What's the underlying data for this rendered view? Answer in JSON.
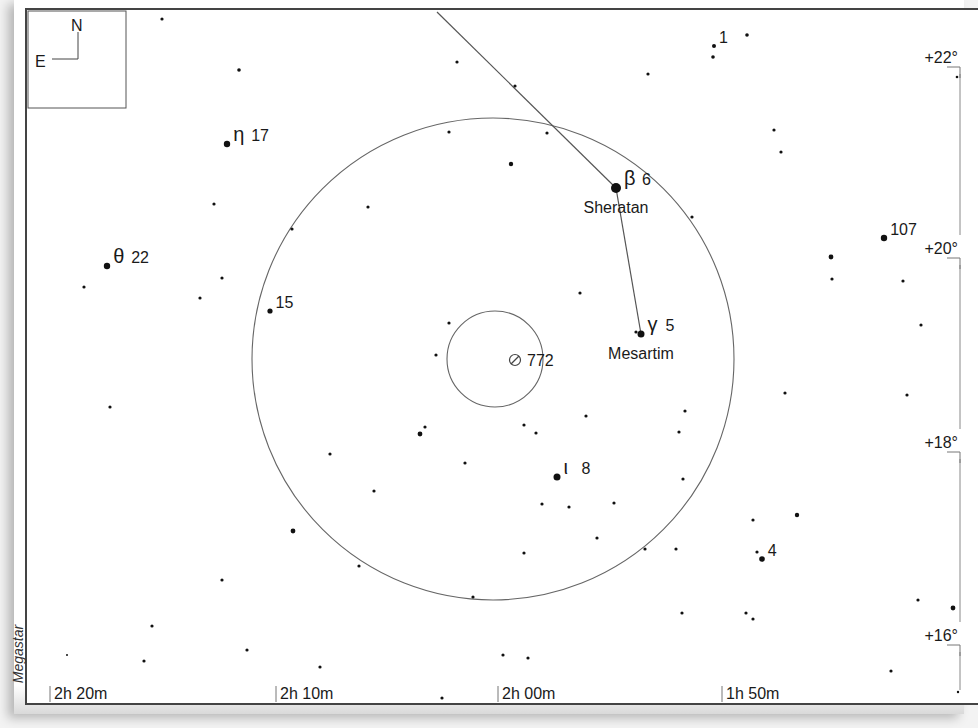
{
  "chart_data": {
    "type": "star-chart",
    "vendor": "Megastar",
    "orientation": {
      "north": "N",
      "east": "E"
    },
    "ra_axis": {
      "ticks": [
        {
          "label": "2h 20m",
          "x": 48
        },
        {
          "label": "2h 10m",
          "x": 274
        },
        {
          "label": "2h 00m",
          "x": 496
        },
        {
          "label": "1h 50m",
          "x": 720
        }
      ]
    },
    "dec_axis": {
      "ticks": [
        {
          "label": "+22°",
          "y": 58
        },
        {
          "label": "+20°",
          "y": 249
        },
        {
          "label": "+18°",
          "y": 443
        },
        {
          "label": "+16°",
          "y": 636
        }
      ]
    },
    "target": {
      "label": "772",
      "symbol": "galaxy",
      "x": 513,
      "y": 358
    },
    "circles": [
      {
        "name": "telrad-inner",
        "cx": 493,
        "cy": 357,
        "r": 48
      },
      {
        "name": "telrad-outer",
        "cx": 491,
        "cy": 357,
        "r": 241
      }
    ],
    "lines": [
      {
        "name": "asterism-line-1",
        "points": [
          [
            435,
            10
          ],
          [
            614,
            186
          ]
        ]
      },
      {
        "name": "asterism-line-2",
        "points": [
          [
            614,
            186
          ],
          [
            639,
            332
          ]
        ]
      }
    ],
    "labeled_stars": [
      {
        "id": "beta-6",
        "greek": "β",
        "flamsteed": "6",
        "name": "Sheratan",
        "x": 614,
        "y": 186,
        "r": 5
      },
      {
        "id": "gamma-5",
        "greek": "γ",
        "flamsteed": "5",
        "name": "Mesartim",
        "x": 639,
        "y": 332,
        "r": 3.5
      },
      {
        "id": "eta-17",
        "greek": "η",
        "flamsteed": "17",
        "name": "",
        "x": 225,
        "y": 142,
        "r": 3.2
      },
      {
        "id": "theta-22",
        "greek": "θ",
        "flamsteed": "22",
        "name": "",
        "x": 105,
        "y": 264,
        "r": 3.2
      },
      {
        "id": "iota-8",
        "greek": "ι",
        "flamsteed": "8",
        "name": "",
        "x": 555,
        "y": 475,
        "r": 3.5
      },
      {
        "id": "15",
        "greek": "",
        "flamsteed": "15",
        "name": "",
        "x": 268,
        "y": 309,
        "r": 2.6
      },
      {
        "id": "107",
        "greek": "",
        "flamsteed": "107",
        "name": "",
        "x": 882,
        "y": 236,
        "r": 3.2
      },
      {
        "id": "1",
        "greek": "",
        "flamsteed": "1",
        "name": "",
        "x": 712,
        "y": 44,
        "r": 2
      },
      {
        "id": "4",
        "greek": "",
        "flamsteed": "4",
        "name": "",
        "x": 760,
        "y": 557,
        "r": 2.8
      }
    ],
    "field_stars": [
      [
        160,
        17,
        1.6
      ],
      [
        237,
        68,
        1.8
      ],
      [
        455,
        60,
        1.6
      ],
      [
        513,
        84,
        1.6
      ],
      [
        646,
        72,
        1.6
      ],
      [
        745,
        33,
        1.8
      ],
      [
        711,
        55,
        1.8
      ],
      [
        955,
        75,
        1.3
      ],
      [
        447,
        130,
        1.6
      ],
      [
        545,
        131,
        1.6
      ],
      [
        509,
        162,
        2.2
      ],
      [
        772,
        128,
        1.6
      ],
      [
        779,
        150,
        1.6
      ],
      [
        212,
        202,
        1.6
      ],
      [
        366,
        205,
        1.6
      ],
      [
        690,
        215,
        1.6
      ],
      [
        290,
        227,
        1.6
      ],
      [
        829,
        255,
        2.4
      ],
      [
        830,
        277,
        1.6
      ],
      [
        901,
        279,
        1.6
      ],
      [
        220,
        276,
        1.6
      ],
      [
        82,
        285,
        1.6
      ],
      [
        198,
        296,
        1.6
      ],
      [
        578,
        291,
        1.6
      ],
      [
        919,
        323,
        1.6
      ],
      [
        447,
        321,
        1.6
      ],
      [
        434,
        353,
        1.6
      ],
      [
        634,
        330,
        1.6
      ],
      [
        783,
        391,
        1.6
      ],
      [
        905,
        393,
        1.6
      ],
      [
        108,
        405,
        1.6
      ],
      [
        683,
        409,
        1.6
      ],
      [
        584,
        414,
        1.6
      ],
      [
        522,
        423,
        1.6
      ],
      [
        534,
        431,
        1.6
      ],
      [
        677,
        430,
        1.6
      ],
      [
        418,
        432,
        2.4
      ],
      [
        423,
        425,
        1.6
      ],
      [
        328,
        452,
        1.6
      ],
      [
        463,
        461,
        1.6
      ],
      [
        372,
        489,
        1.6
      ],
      [
        540,
        502,
        1.6
      ],
      [
        567,
        505,
        1.6
      ],
      [
        612,
        501,
        1.6
      ],
      [
        595,
        536,
        1.6
      ],
      [
        681,
        477,
        1.6
      ],
      [
        291,
        529,
        2.4
      ],
      [
        522,
        551,
        1.6
      ],
      [
        643,
        547,
        1.6
      ],
      [
        674,
        547,
        1.6
      ],
      [
        751,
        518,
        1.6
      ],
      [
        795,
        513,
        2.2
      ],
      [
        755,
        550,
        1.6
      ],
      [
        357,
        564,
        1.6
      ],
      [
        220,
        578,
        1.6
      ],
      [
        471,
        595,
        1.6
      ],
      [
        916,
        598,
        1.6
      ],
      [
        951,
        606,
        2.4
      ],
      [
        680,
        611,
        1.6
      ],
      [
        744,
        611,
        1.6
      ],
      [
        751,
        617,
        1.6
      ],
      [
        150,
        624,
        1.6
      ],
      [
        245,
        648,
        1.6
      ],
      [
        142,
        659,
        1.6
      ],
      [
        65,
        653,
        1.0
      ],
      [
        318,
        665,
        1.6
      ],
      [
        501,
        653,
        1.6
      ],
      [
        526,
        656,
        1.6
      ],
      [
        889,
        669,
        1.6
      ],
      [
        440,
        696,
        1.6
      ],
      [
        956,
        690,
        1.2
      ]
    ]
  }
}
